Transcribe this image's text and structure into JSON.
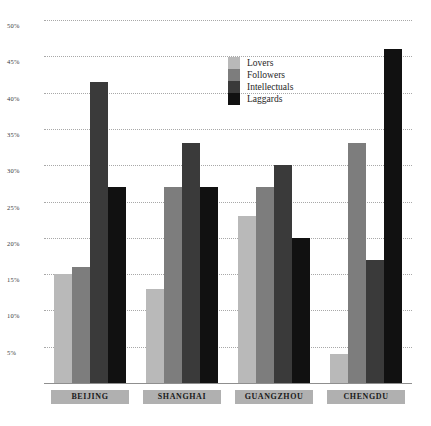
{
  "chart_data": {
    "type": "bar",
    "title": "",
    "xlabel": "",
    "ylabel": "",
    "categories": [
      "BEIJING",
      "SHANGHAI",
      "GUANGZHOU",
      "CHENGDU"
    ],
    "series": [
      {
        "name": "Lovers",
        "color": "#b9b9b9",
        "values": [
          15,
          13,
          23,
          4
        ]
      },
      {
        "name": "Followers",
        "color": "#7d7d7d",
        "values": [
          16,
          27,
          27,
          33
        ]
      },
      {
        "name": "Intellectuals",
        "color": "#3a3a3a",
        "values": [
          41.5,
          33,
          30,
          17
        ]
      },
      {
        "name": "Laggards",
        "color": "#111111",
        "values": [
          27,
          27,
          20,
          46
        ]
      }
    ],
    "ylim": [
      0,
      50
    ],
    "yticks": [
      5,
      10,
      15,
      20,
      25,
      30,
      35,
      40,
      45,
      50
    ],
    "ytick_labels": [
      "5%",
      "10%",
      "15%",
      "20%",
      "25%",
      "30%",
      "35%",
      "40%",
      "45%",
      "50%"
    ],
    "grid": true,
    "legend_position": "top-center",
    "value_suffix": "%"
  },
  "axis": {
    "tick_suffix": "%"
  },
  "top_caption": ""
}
